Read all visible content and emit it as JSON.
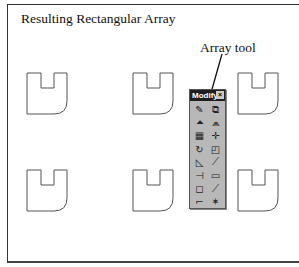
{
  "figure": {
    "title": "Resulting Rectangular Array",
    "callout_label": "Array tool"
  },
  "toolbar": {
    "title": "Modify",
    "close_glyph": "×",
    "buttons": [
      {
        "name": "erase",
        "glyph": "✎"
      },
      {
        "name": "copy",
        "glyph": "⧉"
      },
      {
        "name": "mirror",
        "glyph": "⏶"
      },
      {
        "name": "offset",
        "glyph": "⩕"
      },
      {
        "name": "array",
        "glyph": "▦"
      },
      {
        "name": "move",
        "glyph": "✛"
      },
      {
        "name": "rotate",
        "glyph": "↻"
      },
      {
        "name": "scale",
        "glyph": "◰"
      },
      {
        "name": "stretch",
        "glyph": "◺"
      },
      {
        "name": "trim",
        "glyph": "⟋"
      },
      {
        "name": "extend",
        "glyph": "⊣"
      },
      {
        "name": "break",
        "glyph": "▭"
      },
      {
        "name": "chamfer",
        "glyph": "◻"
      },
      {
        "name": "fillet",
        "glyph": "⟋"
      },
      {
        "name": "lengthen",
        "glyph": "⌐"
      },
      {
        "name": "explode",
        "glyph": "✶"
      }
    ]
  },
  "array": {
    "rows": 2,
    "columns": 3,
    "instances": [
      {
        "row": 1,
        "col": 1,
        "x": 27,
        "y": 73
      },
      {
        "row": 1,
        "col": 2,
        "x": 133,
        "y": 73
      },
      {
        "row": 1,
        "col": 3,
        "x": 238,
        "y": 73
      },
      {
        "row": 2,
        "col": 1,
        "x": 27,
        "y": 170
      },
      {
        "row": 2,
        "col": 2,
        "x": 133,
        "y": 170
      },
      {
        "row": 2,
        "col": 3,
        "x": 238,
        "y": 170
      }
    ]
  },
  "colors": {
    "line": "#555555",
    "frame": "#333333",
    "toolbar_bg": "#b8b8b8",
    "toolbar_title_bg": "#1f1f1f"
  }
}
